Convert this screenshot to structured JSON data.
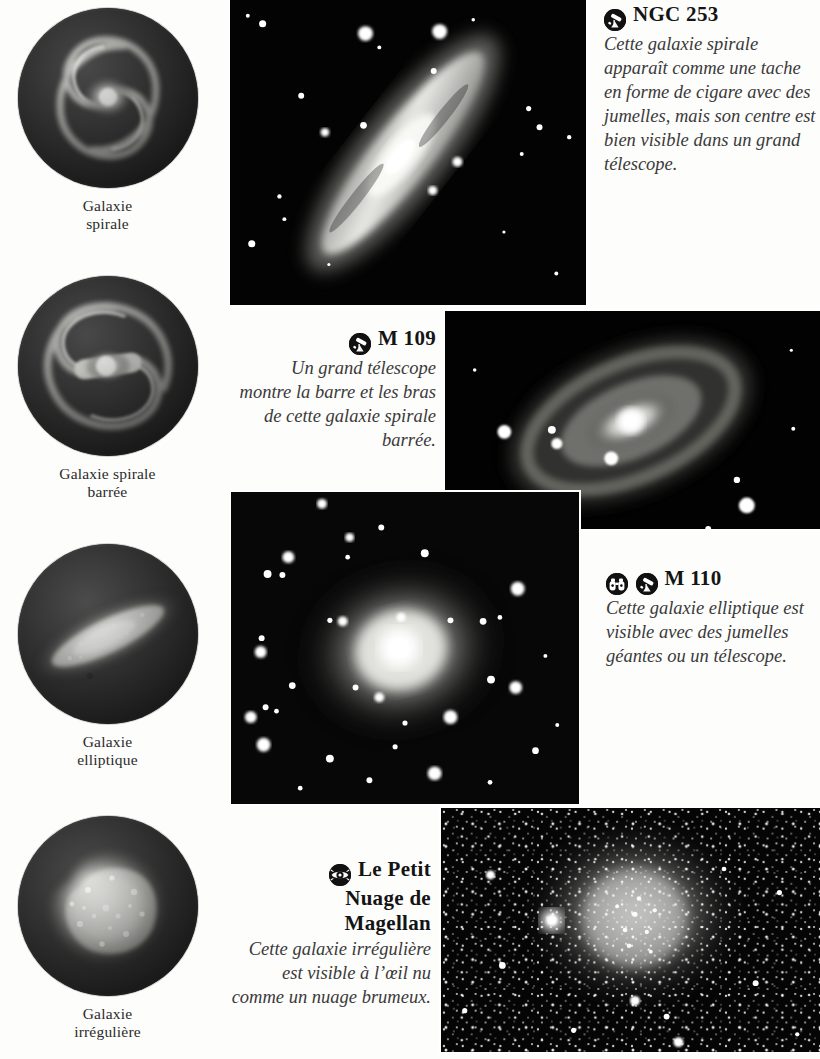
{
  "page": {
    "language": "fr",
    "background_color": "#fdfdfc",
    "text_color": "#1a1a1a"
  },
  "illustrations": [
    {
      "id": "spiral",
      "label": "Galaxie\nspirale",
      "label_line1": "Galaxie",
      "label_line2": "spirale",
      "type": "spiral-galaxy-diagram"
    },
    {
      "id": "barred-spiral",
      "label": "Galaxie spirale\nbarrée",
      "label_line1": "Galaxie spirale",
      "label_line2": "barrée",
      "type": "barred-spiral-galaxy-diagram"
    },
    {
      "id": "elliptical",
      "label": "Galaxie\nelliptique",
      "label_line1": "Galaxie",
      "label_line2": "elliptique",
      "type": "elliptical-galaxy-diagram"
    },
    {
      "id": "irregular",
      "label": "Galaxie\nirrégulière",
      "label_line1": "Galaxie",
      "label_line2": "irrégulière",
      "type": "irregular-galaxy-diagram"
    }
  ],
  "captions": [
    {
      "id": "ngc253",
      "title": "NGC 253",
      "icons": [
        "telescope-icon"
      ],
      "body": "Cette galaxie spirale apparaît comme une tache en forme de cigare avec des jumelles, mais son centre est bien visible dans un grand télescope.",
      "align": "left"
    },
    {
      "id": "m109",
      "title": "M 109",
      "icons": [
        "telescope-icon"
      ],
      "body": "Un grand télescope montre la barre et les bras de cette galaxie spirale barrée.",
      "align": "right"
    },
    {
      "id": "m110",
      "title": "M 110",
      "icons": [
        "binoculars-icon",
        "telescope-icon"
      ],
      "body": "Cette galaxie elliptique est visible avec des jumelles géantes ou un télescope.",
      "align": "left"
    },
    {
      "id": "smc",
      "title_line1": "Le Petit",
      "title_line2": "Nuage de",
      "title_line3": "Magellan",
      "title": "Le Petit Nuage de Magellan",
      "icons": [
        "eye-icon"
      ],
      "body": "Cette galaxie irrégulière est visible à l’œil nu comme un nuage brumeux.",
      "align": "right"
    }
  ],
  "photos": [
    {
      "id": "ngc253-photo",
      "subject": "NGC 253",
      "description": "Galaxie spirale vue par la tranche"
    },
    {
      "id": "m109-photo",
      "subject": "M 109",
      "description": "Galaxie spirale barrée"
    },
    {
      "id": "m110-photo",
      "subject": "M 110",
      "description": "Galaxie elliptique"
    },
    {
      "id": "smc-photo",
      "subject": "Le Petit Nuage de Magellan",
      "description": "Galaxie irrégulière, champ d’étoiles dense"
    }
  ]
}
